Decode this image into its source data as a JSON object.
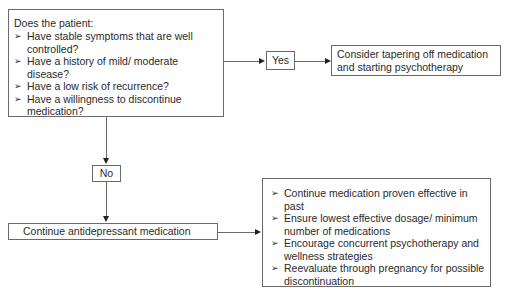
{
  "question_box": {
    "heading": "Does the patient:",
    "bullet_glyph": "➢",
    "items": [
      "Have stable symptoms that are well controlled?",
      "Have a history of mild/ moderate disease?",
      "Have a low risk of recurrence?",
      "Have a willingness to discontinue medication?"
    ]
  },
  "yes_label": "Yes",
  "no_label": "No",
  "yes_outcome": "Consider tapering off medication and starting psychotherapy",
  "no_outcome": "Continue antidepressant medication",
  "recommendations": {
    "bullet_glyph": "➢",
    "items": [
      "Continue medication proven effective in past",
      "Ensure lowest effective dosage/ minimum number of medications",
      "Encourage concurrent psychotherapy and wellness strategies",
      "Reevaluate through pregnancy for possible discontinuation"
    ]
  }
}
